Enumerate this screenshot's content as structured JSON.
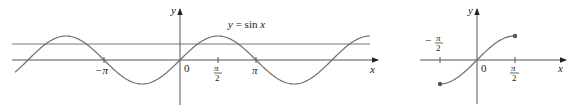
{
  "figures": [
    {
      "id": "left",
      "description": "Graph of y = sin x with a horizontal line intersecting it",
      "curve_label": "y = sin x",
      "axis_x_label": "x",
      "axis_y_label": "y",
      "origin_label": "0",
      "ticks": [
        {
          "value": "-π",
          "label": "−π"
        },
        {
          "value": "π/2",
          "label_num": "π",
          "label_den": "2"
        },
        {
          "value": "π",
          "label": "π"
        }
      ],
      "horizontal_line": "y = c (0 < c < 1)"
    },
    {
      "id": "right",
      "description": "Restricted sine on [-π/2, π/2]",
      "axis_x_label": "x",
      "axis_y_label": "y",
      "origin_label": "0",
      "ticks": [
        {
          "value": "-π/2",
          "label_num": "π",
          "label_den": "2",
          "sign": "−"
        },
        {
          "value": "π/2",
          "label_num": "π",
          "label_den": "2"
        }
      ]
    }
  ],
  "chart_data": [
    {
      "type": "line",
      "title": "y = sin x",
      "xlabel": "x",
      "ylabel": "y",
      "x_range": [
        -5.9,
        6.6
      ],
      "y_range": [
        -1,
        1
      ],
      "series": [
        {
          "name": "sin x",
          "function": "sin(x)"
        }
      ],
      "reference_lines": [
        {
          "type": "horizontal",
          "y": 0.65
        }
      ],
      "x_ticks": [
        "−π",
        "0",
        "π/2",
        "π"
      ],
      "grid": false
    },
    {
      "type": "line",
      "title": "",
      "xlabel": "x",
      "ylabel": "y",
      "x_range": [
        -1.5708,
        1.5708
      ],
      "y_range": [
        -1,
        1
      ],
      "series": [
        {
          "name": "sin x restricted",
          "function": "sin(x)",
          "domain": "[-π/2, π/2]",
          "closed_endpoints": true
        }
      ],
      "x_ticks": [
        "−π/2",
        "0",
        "π/2"
      ],
      "grid": false
    }
  ]
}
